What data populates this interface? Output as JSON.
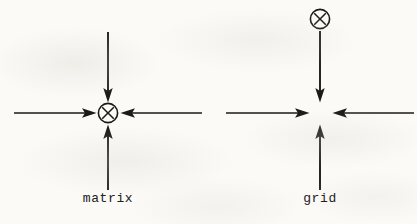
{
  "page": {
    "width": 417,
    "height": 224,
    "background_color": "#fbfaf7",
    "ink_color": "#1c1916"
  },
  "figures": [
    {
      "id": "matrix-figure",
      "label": "matrix",
      "label_x": 108,
      "label_y": 198,
      "center_x": 108,
      "center_y": 113,
      "node": {
        "symbol": "circled-x",
        "glyph": "⊗",
        "x": 108,
        "y": 113,
        "radius": 10,
        "position": "center"
      },
      "arrows": [
        {
          "name": "arrow-down-into-node",
          "direction": "down",
          "from_x": 108,
          "from_y": 32,
          "to_x": 108,
          "to_y": 101
        },
        {
          "name": "arrow-right-into-node",
          "direction": "right",
          "from_x": 14,
          "from_y": 113,
          "to_x": 96,
          "to_y": 113
        },
        {
          "name": "arrow-left-into-node",
          "direction": "left",
          "from_x": 202,
          "from_y": 113,
          "to_x": 121,
          "to_y": 113
        },
        {
          "name": "arrow-up-into-node",
          "direction": "up",
          "from_x": 108,
          "from_y": 190,
          "to_x": 108,
          "to_y": 126
        }
      ]
    },
    {
      "id": "grid-figure",
      "label": "grid",
      "label_x": 320,
      "label_y": 198,
      "center_x": 320,
      "center_y": 113,
      "node": {
        "symbol": "circled-x",
        "glyph": "⊗",
        "x": 320,
        "y": 19,
        "radius": 10,
        "position": "top"
      },
      "arrows": [
        {
          "name": "arrow-down-from-node",
          "direction": "down",
          "from_x": 320,
          "from_y": 31,
          "to_x": 320,
          "to_y": 101
        },
        {
          "name": "arrow-right-into-center",
          "direction": "right",
          "from_x": 226,
          "from_y": 113,
          "to_x": 309,
          "to_y": 113
        },
        {
          "name": "arrow-left-into-center",
          "direction": "left",
          "from_x": 414,
          "from_y": 113,
          "to_x": 333,
          "to_y": 113
        },
        {
          "name": "arrow-up-into-center",
          "direction": "up",
          "from_x": 320,
          "from_y": 190,
          "to_x": 320,
          "to_y": 126
        }
      ]
    }
  ]
}
